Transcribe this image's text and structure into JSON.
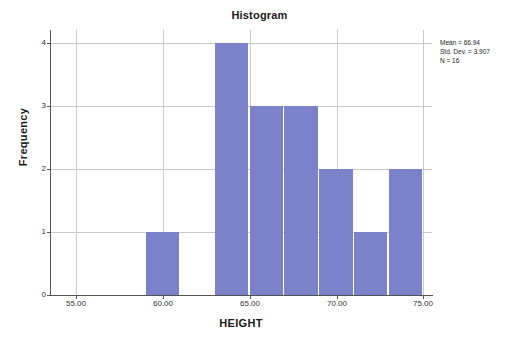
{
  "chart_data": {
    "type": "bar",
    "title": "Histogram",
    "xlabel": "HEIGHT",
    "ylabel": "Frequency",
    "xlim": [
      53.5,
      75.5
    ],
    "ylim": [
      0,
      4
    ],
    "grid": true,
    "legend": "none",
    "bin_width": 2,
    "bars": [
      {
        "bin_start": 59,
        "bin_end": 61,
        "center": 60,
        "value": 1
      },
      {
        "bin_start": 63,
        "bin_end": 65,
        "center": 64,
        "value": 4
      },
      {
        "bin_start": 65,
        "bin_end": 67,
        "center": 66,
        "value": 3
      },
      {
        "bin_start": 67,
        "bin_end": 69,
        "center": 68,
        "value": 3
      },
      {
        "bin_start": 69,
        "bin_end": 71,
        "center": 70,
        "value": 2
      },
      {
        "bin_start": 71,
        "bin_end": 73,
        "center": 72,
        "value": 1
      },
      {
        "bin_start": 73,
        "bin_end": 75,
        "center": 74,
        "value": 2
      }
    ],
    "categories": [
      "59-61",
      "63-65",
      "65-67",
      "67-69",
      "69-71",
      "71-73",
      "73-75"
    ],
    "values": [
      1,
      4,
      3,
      3,
      2,
      1,
      2
    ],
    "xticks": [
      "55.00",
      "60.00",
      "65.00",
      "70.00",
      "75.00"
    ],
    "xtick_values": [
      55,
      60,
      65,
      70,
      75
    ],
    "yticks": [
      "0",
      "1",
      "2",
      "3",
      "4"
    ],
    "ytick_values": [
      0,
      1,
      2,
      3,
      4
    ],
    "bar_color": "#7b82ca",
    "grid_color": "#c9c9c9",
    "axis_color": "#555555"
  },
  "annotations": {
    "stats": [
      "Mean = 66.94",
      "Std. Dev. = 3.907",
      "N = 16"
    ]
  }
}
